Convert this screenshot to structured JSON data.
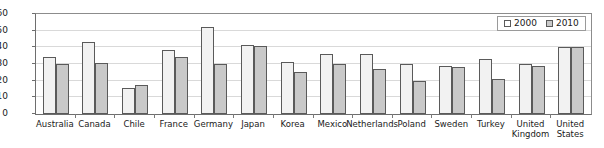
{
  "chart_data": {
    "type": "bar",
    "title": "",
    "subtitle": "",
    "xlabel": "",
    "ylabel": "",
    "ylim": [
      0,
      60
    ],
    "yticks": [
      0,
      10,
      20,
      30,
      40,
      50,
      60
    ],
    "grid": true,
    "legend_position": "top-right",
    "categories": [
      "Australia",
      "Canada",
      "Chile",
      "France",
      "Germany",
      "Japan",
      "Korea",
      "Mexico",
      "Netherlands",
      "Poland",
      "Sweden",
      "Turkey",
      "United\nKingdom",
      "United\nStates"
    ],
    "series": [
      {
        "name": "2000",
        "color": "#f2f2f2",
        "values": [
          34.5,
          43.5,
          15.5,
          38.5,
          52.0,
          41.5,
          31.0,
          36.0,
          36.0,
          30.0,
          29.0,
          33.0,
          30.0,
          40.0
        ]
      },
      {
        "name": "2010",
        "color": "#c9c9c9",
        "values": [
          30.0,
          30.5,
          17.5,
          34.5,
          30.0,
          41.0,
          25.0,
          30.0,
          27.0,
          20.0,
          28.0,
          21.0,
          29.0,
          40.0
        ]
      }
    ]
  },
  "legend": {
    "items": [
      {
        "label": "2000",
        "swatch": "swatch-unfilled"
      },
      {
        "label": "2010",
        "swatch": "swatch-gray"
      }
    ]
  }
}
